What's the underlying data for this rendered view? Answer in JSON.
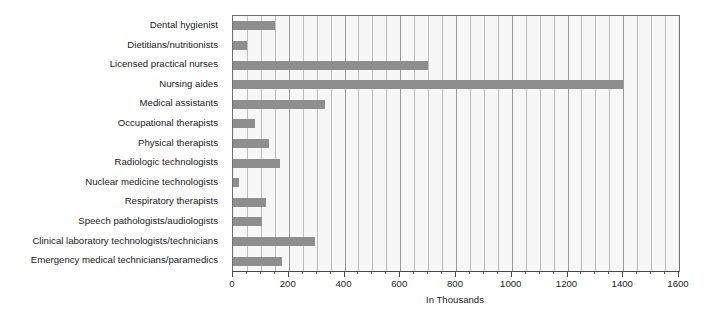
{
  "chart_data": {
    "type": "bar",
    "orientation": "horizontal",
    "title": "",
    "xlabel": "In Thousands",
    "ylabel": "",
    "xlim": [
      0,
      1600
    ],
    "ylim": null,
    "grid": true,
    "grid_axis": "x",
    "legend": null,
    "bar_color": "#8e8e8e",
    "plot_background": "#f7f7f7",
    "x_major_ticks": [
      0,
      200,
      400,
      600,
      800,
      1000,
      1200,
      1400,
      1600
    ],
    "x_tick_labels": [
      "0",
      "200",
      "400",
      "600",
      "800",
      "1000",
      "1200",
      "1400",
      "1600"
    ],
    "x_minor_tick_interval": 50,
    "categories": [
      "Dental hygienist",
      "Dietitians/nutritionists",
      "Licensed practical nurses",
      "Nursing aides",
      "Medical assistants",
      "Occupational therapists",
      "Physical therapists",
      "Radiologic technologists",
      "Nuclear medicine technologists",
      "Respiratory therapists",
      "Speech pathologists/audiologists",
      "Clinical laboratory technologists/technicians",
      "Emergency medical technicians/paramedics"
    ],
    "values": [
      150,
      50,
      700,
      1400,
      330,
      80,
      130,
      170,
      20,
      120,
      105,
      295,
      175
    ]
  }
}
